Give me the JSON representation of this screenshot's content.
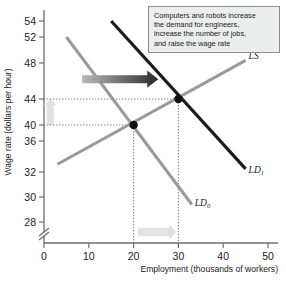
{
  "chart_data": {
    "type": "line",
    "title": "",
    "xlabel": "Employment (thousands of workers)",
    "ylabel": "Wage rate (dollars per hour)",
    "xlim": [
      0,
      51
    ],
    "ylim": [
      26,
      55.5
    ],
    "xticks": [
      "0",
      "10",
      "20",
      "30",
      "40",
      "50"
    ],
    "xtick_values": [
      0,
      10,
      20,
      30,
      40,
      50
    ],
    "yticks": [
      "28",
      "30",
      "32",
      "36",
      "40",
      "44",
      "48",
      "52",
      "54"
    ],
    "ytick_values": [
      28,
      30,
      32,
      36,
      40,
      44,
      48,
      52,
      54
    ],
    "y_axis_break": true,
    "grid": false,
    "legend": "inline-curve-labels",
    "series": [
      {
        "name": "LS",
        "label": "LS",
        "label_sub": "",
        "color": "#9a9a9a",
        "kind": "supply",
        "points": [
          [
            3,
            33
          ],
          [
            45,
            48.4
          ]
        ]
      },
      {
        "name": "LD0",
        "label": "LD",
        "label_sub": "0",
        "color": "#9a9a9a",
        "kind": "demand-initial",
        "points": [
          [
            5,
            52
          ],
          [
            33,
            29.4
          ]
        ]
      },
      {
        "name": "LD1",
        "label": "LD",
        "label_sub": "1",
        "color": "#1b1b1b",
        "kind": "demand-new",
        "points": [
          [
            15,
            54
          ],
          [
            45,
            32.4
          ]
        ]
      }
    ],
    "equilibria": [
      {
        "name": "initial-equilibrium",
        "x": 20,
        "y": 40,
        "marker": "circle",
        "color": "#111111"
      },
      {
        "name": "new-equilibrium",
        "x": 30,
        "y": 44,
        "marker": "circle",
        "color": "#111111"
      }
    ],
    "dropline_values": {
      "wage_initial": 40,
      "wage_new": 44,
      "employment_initial": 20,
      "employment_new": 30
    },
    "annotations": [
      {
        "name": "demand-shift-arrow",
        "type": "arrow",
        "direction": "right",
        "color_start": "#b9b9b9",
        "color_end": "#2a2a2a",
        "from": [
          8.5,
          46.2
        ],
        "to": [
          25.5,
          46.2
        ]
      },
      {
        "name": "wage-increase-arrow",
        "type": "arrow",
        "direction": "up",
        "color": "#e2e2e2",
        "from": [
          1.4,
          40
        ],
        "to": [
          1.4,
          44
        ]
      },
      {
        "name": "employment-increase-arrow",
        "type": "arrow",
        "direction": "right",
        "color": "#e2e2e2",
        "from": [
          21,
          27.2
        ],
        "to": [
          29.5,
          27.2
        ]
      }
    ]
  },
  "callout": {
    "name": "explanation-box",
    "lines": [
      "Computers and robots increase",
      "the demand for engineers,",
      "increase the number of jobs,",
      "and raise the wage rate"
    ]
  },
  "colors": {
    "gray_curve": "#9a9a9a",
    "black_curve": "#1b1b1b",
    "axis": "#6f6f6f",
    "dotted": "#7a7a7a",
    "callout_bg": "#eceded",
    "callout_border": "#8a8f93",
    "text": "#1b1b1b",
    "faint_arrow": "#e2e2e2"
  }
}
